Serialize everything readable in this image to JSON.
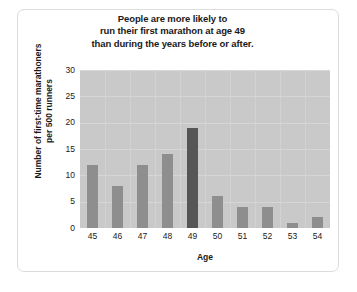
{
  "figure": {
    "title_lines": [
      "People are more likely to",
      "run their first marathon at age 49",
      "than during the years before or after."
    ]
  },
  "chart_data": {
    "type": "bar",
    "title": "People are more likely to run their first marathon at age 49 than during the years before or after.",
    "xlabel": "Age",
    "ylabel": "Number of first-time marathoners per 500 runners",
    "ylabel_lines": [
      "Number of first-time marathoners",
      "per 500 runners"
    ],
    "categories": [
      "45",
      "46",
      "47",
      "48",
      "49",
      "50",
      "51",
      "52",
      "53",
      "54"
    ],
    "values": [
      12,
      8,
      12,
      14,
      19,
      6,
      4,
      4,
      1,
      2
    ],
    "highlight_category": "49",
    "ylim": [
      0,
      30
    ],
    "yticks": [
      "0",
      "5",
      "10",
      "15",
      "20",
      "25",
      "30"
    ],
    "ytick_values": [
      0,
      5,
      10,
      15,
      20,
      25,
      30
    ],
    "grid": true,
    "legend": "none",
    "colors": {
      "bar": "#8e8e8e",
      "bar_highlight": "#565656",
      "plot_background": "#c9c9c9",
      "gridline": "#d8d8d8",
      "text": "#1a1a1a",
      "frame": "#dcdcdc"
    }
  }
}
